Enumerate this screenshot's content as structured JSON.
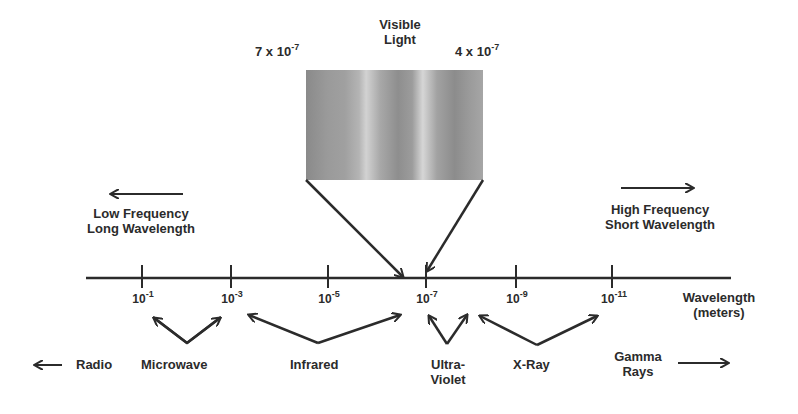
{
  "visible_light": {
    "title_line1": "Visible",
    "title_line2": "Light",
    "left_bound": {
      "base": "7 x 10",
      "exp": "-7"
    },
    "right_bound": {
      "base": "4 x 10",
      "exp": "-7"
    }
  },
  "direction_labels": {
    "low": {
      "line1": "Low Frequency",
      "line2": "Long Wavelength",
      "arrow": "left-arrow"
    },
    "high": {
      "line1": "High Frequency",
      "line2": "Short Wavelength",
      "arrow": "right-arrow"
    }
  },
  "axis": {
    "label_line1": "Wavelength",
    "label_line2": "(meters)",
    "ticks": [
      {
        "base": "10",
        "exp": "-1"
      },
      {
        "base": "10",
        "exp": "-3"
      },
      {
        "base": "10",
        "exp": "-5"
      },
      {
        "base": "10",
        "exp": "-7"
      },
      {
        "base": "10",
        "exp": "-9"
      },
      {
        "base": "10",
        "exp": "-11"
      }
    ]
  },
  "bands": [
    {
      "name": "Radio",
      "line1": "Radio"
    },
    {
      "name": "Microwave",
      "line1": "Microwave"
    },
    {
      "name": "Infrared",
      "line1": "Infrared"
    },
    {
      "name": "Ultraviolet",
      "line1": "Ultra-",
      "line2": "Violet"
    },
    {
      "name": "X-Ray",
      "line1": "X-Ray"
    },
    {
      "name": "Gamma Rays",
      "line1": "Gamma",
      "line2": "Rays"
    }
  ],
  "colors": {
    "ink": "#2b2b2b",
    "spectrum_gray": "#9a9a9a"
  }
}
